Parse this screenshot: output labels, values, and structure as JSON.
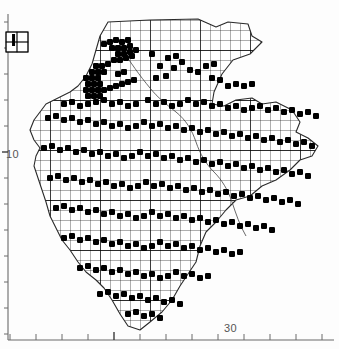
{
  "figure": {
    "type": "distribution-atlas-map",
    "title": "",
    "background_color": "#ffffff",
    "ink_color": "#000000",
    "axis_color": "#555555"
  },
  "axes": {
    "left": {
      "name": "northing-axis",
      "labels": [
        {
          "text": "10",
          "y": 155
        }
      ],
      "tick_count": 13,
      "tick_spacing_px": 26,
      "tick_start_px": 22,
      "major_tick_index": 5
    },
    "bottom": {
      "name": "easting-axis",
      "labels": [
        {
          "text": "30",
          "x": 232
        }
      ],
      "tick_count": 13,
      "tick_spacing_px": 26,
      "tick_start_px": 10,
      "major_tick_index": 4
    }
  },
  "legend": {
    "name": "scale-key-box",
    "x": 6,
    "y": 32,
    "width": 22,
    "height": 20,
    "cols": 2,
    "rows": 2,
    "description": "grid square size key"
  },
  "grid": {
    "cell_size_px": 10,
    "minor_color": "#111111",
    "major_every": 5,
    "major_color": "#000000",
    "origin_x": 22,
    "origin_y": 18
  },
  "symbol": {
    "name": "occurrence-dot",
    "shape": "filled-square",
    "size_px": 6,
    "color": "#000000"
  },
  "chart_data": {
    "type": "scatter",
    "title": "",
    "xlabel": "",
    "ylabel": "",
    "grid": true,
    "legend_position": "top-left",
    "xlim": [
      0,
      339
    ],
    "ylim": [
      349,
      0
    ],
    "region_outline": "M 108,22 L 150,20 L 198,19 L 216,27 L 228,22 L 248,24 L 252,36 L 262,42 L 250,54 L 233,60 L 222,74 L 214,92 L 212,104 L 224,106 L 236,100 L 252,98 L 262,104 L 276,102 L 292,110 L 300,122 L 296,132 L 308,138 L 318,146 L 312,156 L 300,160 L 290,170 L 276,180 L 262,186 L 250,196 L 236,200 L 226,210 L 216,222 L 206,232 L 200,246 L 196,262 L 188,274 L 180,286 L 172,300 L 162,312 L 150,322 L 140,330 L 128,326 L 120,314 L 112,300 L 104,288 L 96,280 L 86,272 L 78,262 L 70,250 L 62,240 L 56,228 L 50,216 L 46,202 L 42,190 L 38,178 L 34,166 L 36,156 L 40,148 L 34,140 L 30,130 L 34,120 L 40,112 L 46,104 L 54,100 L 62,96 L 70,92 L 78,86 L 86,76 L 92,64 L 96,50 L 100,36 Z",
    "points": [
      [
        104,
        44
      ],
      [
        110,
        42
      ],
      [
        116,
        40
      ],
      [
        122,
        42
      ],
      [
        128,
        40
      ],
      [
        112,
        48
      ],
      [
        118,
        48
      ],
      [
        124,
        48
      ],
      [
        130,
        46
      ],
      [
        118,
        54
      ],
      [
        124,
        54
      ],
      [
        130,
        52
      ],
      [
        136,
        50
      ],
      [
        114,
        60
      ],
      [
        120,
        60
      ],
      [
        126,
        58
      ],
      [
        132,
        56
      ],
      [
        152,
        54
      ],
      [
        96,
        66
      ],
      [
        102,
        66
      ],
      [
        108,
        64
      ],
      [
        92,
        72
      ],
      [
        98,
        72
      ],
      [
        104,
        72
      ],
      [
        86,
        78
      ],
      [
        92,
        78
      ],
      [
        98,
        78
      ],
      [
        88,
        84
      ],
      [
        94,
        84
      ],
      [
        100,
        84
      ],
      [
        86,
        90
      ],
      [
        92,
        90
      ],
      [
        98,
        90
      ],
      [
        88,
        96
      ],
      [
        94,
        96
      ],
      [
        100,
        96
      ],
      [
        104,
        90
      ],
      [
        110,
        88
      ],
      [
        116,
        86
      ],
      [
        122,
        84
      ],
      [
        128,
        82
      ],
      [
        134,
        80
      ],
      [
        118,
        74
      ],
      [
        124,
        72
      ],
      [
        168,
        58
      ],
      [
        176,
        56
      ],
      [
        182,
        62
      ],
      [
        174,
        68
      ],
      [
        160,
        66
      ],
      [
        156,
        78
      ],
      [
        166,
        76
      ],
      [
        190,
        70
      ],
      [
        198,
        72
      ],
      [
        206,
        66
      ],
      [
        214,
        64
      ],
      [
        212,
        78
      ],
      [
        220,
        80
      ],
      [
        228,
        86
      ],
      [
        236,
        84
      ],
      [
        244,
        86
      ],
      [
        252,
        84
      ],
      [
        64,
        104
      ],
      [
        72,
        102
      ],
      [
        80,
        106
      ],
      [
        88,
        104
      ],
      [
        96,
        102
      ],
      [
        104,
        100
      ],
      [
        112,
        104
      ],
      [
        120,
        102
      ],
      [
        128,
        106
      ],
      [
        136,
        104
      ],
      [
        148,
        100
      ],
      [
        156,
        104
      ],
      [
        164,
        102
      ],
      [
        172,
        106
      ],
      [
        180,
        104
      ],
      [
        188,
        100
      ],
      [
        196,
        104
      ],
      [
        204,
        102
      ],
      [
        212,
        106
      ],
      [
        220,
        104
      ],
      [
        228,
        108
      ],
      [
        236,
        106
      ],
      [
        244,
        110
      ],
      [
        252,
        108
      ],
      [
        260,
        106
      ],
      [
        268,
        110
      ],
      [
        276,
        108
      ],
      [
        284,
        112
      ],
      [
        292,
        110
      ],
      [
        300,
        114
      ],
      [
        308,
        112
      ],
      [
        316,
        116
      ],
      [
        48,
        118
      ],
      [
        56,
        116
      ],
      [
        64,
        120
      ],
      [
        72,
        118
      ],
      [
        80,
        122
      ],
      [
        88,
        120
      ],
      [
        96,
        124
      ],
      [
        104,
        122
      ],
      [
        112,
        126
      ],
      [
        120,
        124
      ],
      [
        128,
        128
      ],
      [
        136,
        126
      ],
      [
        144,
        122
      ],
      [
        152,
        126
      ],
      [
        160,
        124
      ],
      [
        168,
        128
      ],
      [
        176,
        126
      ],
      [
        184,
        130
      ],
      [
        192,
        128
      ],
      [
        200,
        132
      ],
      [
        208,
        130
      ],
      [
        216,
        134
      ],
      [
        224,
        132
      ],
      [
        232,
        136
      ],
      [
        240,
        134
      ],
      [
        248,
        138
      ],
      [
        256,
        136
      ],
      [
        264,
        140
      ],
      [
        272,
        138
      ],
      [
        280,
        142
      ],
      [
        288,
        140
      ],
      [
        296,
        144
      ],
      [
        304,
        142
      ],
      [
        312,
        146
      ],
      [
        44,
        148
      ],
      [
        52,
        146
      ],
      [
        60,
        150
      ],
      [
        68,
        148
      ],
      [
        76,
        152
      ],
      [
        84,
        150
      ],
      [
        92,
        154
      ],
      [
        100,
        152
      ],
      [
        108,
        156
      ],
      [
        116,
        154
      ],
      [
        124,
        158
      ],
      [
        132,
        156
      ],
      [
        140,
        152
      ],
      [
        148,
        156
      ],
      [
        156,
        154
      ],
      [
        164,
        158
      ],
      [
        172,
        156
      ],
      [
        180,
        160
      ],
      [
        188,
        158
      ],
      [
        196,
        162
      ],
      [
        204,
        160
      ],
      [
        212,
        164
      ],
      [
        220,
        162
      ],
      [
        228,
        166
      ],
      [
        236,
        164
      ],
      [
        244,
        168
      ],
      [
        252,
        166
      ],
      [
        260,
        170
      ],
      [
        268,
        168
      ],
      [
        276,
        172
      ],
      [
        284,
        170
      ],
      [
        292,
        174
      ],
      [
        300,
        172
      ],
      [
        308,
        176
      ],
      [
        50,
        178
      ],
      [
        58,
        176
      ],
      [
        66,
        180
      ],
      [
        74,
        178
      ],
      [
        82,
        182
      ],
      [
        90,
        180
      ],
      [
        98,
        184
      ],
      [
        106,
        182
      ],
      [
        114,
        186
      ],
      [
        122,
        184
      ],
      [
        130,
        188
      ],
      [
        138,
        186
      ],
      [
        146,
        182
      ],
      [
        154,
        186
      ],
      [
        162,
        184
      ],
      [
        170,
        188
      ],
      [
        178,
        186
      ],
      [
        186,
        190
      ],
      [
        194,
        188
      ],
      [
        202,
        192
      ],
      [
        210,
        190
      ],
      [
        218,
        194
      ],
      [
        226,
        192
      ],
      [
        234,
        196
      ],
      [
        242,
        194
      ],
      [
        250,
        198
      ],
      [
        258,
        196
      ],
      [
        266,
        200
      ],
      [
        274,
        198
      ],
      [
        282,
        202
      ],
      [
        290,
        200
      ],
      [
        298,
        204
      ],
      [
        56,
        208
      ],
      [
        64,
        206
      ],
      [
        72,
        210
      ],
      [
        80,
        208
      ],
      [
        88,
        212
      ],
      [
        96,
        210
      ],
      [
        104,
        214
      ],
      [
        112,
        212
      ],
      [
        120,
        216
      ],
      [
        128,
        214
      ],
      [
        136,
        218
      ],
      [
        144,
        216
      ],
      [
        152,
        212
      ],
      [
        160,
        216
      ],
      [
        168,
        214
      ],
      [
        176,
        218
      ],
      [
        184,
        216
      ],
      [
        192,
        220
      ],
      [
        200,
        218
      ],
      [
        208,
        222
      ],
      [
        216,
        220
      ],
      [
        224,
        224
      ],
      [
        232,
        222
      ],
      [
        240,
        226
      ],
      [
        248,
        224
      ],
      [
        256,
        228
      ],
      [
        264,
        226
      ],
      [
        272,
        230
      ],
      [
        64,
        238
      ],
      [
        72,
        236
      ],
      [
        80,
        240
      ],
      [
        88,
        238
      ],
      [
        96,
        242
      ],
      [
        104,
        240
      ],
      [
        112,
        244
      ],
      [
        120,
        242
      ],
      [
        128,
        246
      ],
      [
        136,
        244
      ],
      [
        144,
        248
      ],
      [
        152,
        246
      ],
      [
        160,
        242
      ],
      [
        168,
        246
      ],
      [
        176,
        244
      ],
      [
        184,
        248
      ],
      [
        192,
        246
      ],
      [
        200,
        250
      ],
      [
        208,
        248
      ],
      [
        216,
        252
      ],
      [
        224,
        250
      ],
      [
        232,
        254
      ],
      [
        240,
        252
      ],
      [
        80,
        268
      ],
      [
        88,
        266
      ],
      [
        96,
        270
      ],
      [
        104,
        268
      ],
      [
        112,
        272
      ],
      [
        120,
        270
      ],
      [
        128,
        274
      ],
      [
        136,
        272
      ],
      [
        144,
        276
      ],
      [
        152,
        274
      ],
      [
        160,
        278
      ],
      [
        168,
        276
      ],
      [
        176,
        272
      ],
      [
        184,
        276
      ],
      [
        192,
        274
      ],
      [
        200,
        278
      ],
      [
        208,
        276
      ],
      [
        100,
        294
      ],
      [
        108,
        292
      ],
      [
        116,
        296
      ],
      [
        124,
        294
      ],
      [
        132,
        298
      ],
      [
        140,
        296
      ],
      [
        148,
        300
      ],
      [
        156,
        298
      ],
      [
        164,
        302
      ],
      [
        172,
        300
      ],
      [
        180,
        304
      ],
      [
        128,
        314
      ],
      [
        136,
        312
      ],
      [
        144,
        316
      ],
      [
        152,
        314
      ],
      [
        160,
        318
      ]
    ],
    "point_count": 312
  }
}
